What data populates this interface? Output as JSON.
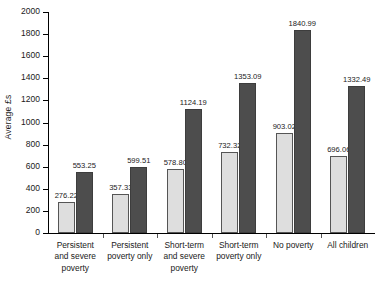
{
  "chart_data": {
    "type": "bar",
    "title": "",
    "xlabel": "",
    "ylabel": "Average £s",
    "ylim": [
      0,
      2000
    ],
    "ytick_step": 200,
    "yticks": [
      "0",
      "200",
      "400",
      "600",
      "800",
      "1000",
      "1200",
      "1400",
      "1600",
      "1800",
      "2000"
    ],
    "grid": false,
    "legend": "none",
    "categories": [
      "Persistent and severe poverty",
      "Persistent poverty only",
      "Short-term and severe poverty",
      "Short-term poverty only",
      "No poverty",
      "All children"
    ],
    "category_lines": [
      [
        "Persistent",
        "and severe",
        "poverty"
      ],
      [
        "Persistent",
        "poverty only"
      ],
      [
        "Short-term",
        "and severe",
        "poverty"
      ],
      [
        "Short-term",
        "poverty only"
      ],
      [
        "No poverty"
      ],
      [
        "All children"
      ]
    ],
    "series": [
      {
        "name": "light",
        "color": "#dedede",
        "values": [
          276.22,
          357.33,
          578.8,
          732.32,
          903.02,
          696.06
        ],
        "labels": [
          "276.22",
          "357.33",
          "578.80",
          "732.32",
          "903.02",
          "696.06"
        ]
      },
      {
        "name": "dark",
        "color": "#4d4d4d",
        "values": [
          553.25,
          599.51,
          1124.19,
          1353.09,
          1840.99,
          1332.49
        ],
        "labels": [
          "553.25",
          "599.51",
          "1124.19",
          "1353.09",
          "1840.99",
          "1332.49"
        ]
      }
    ]
  }
}
